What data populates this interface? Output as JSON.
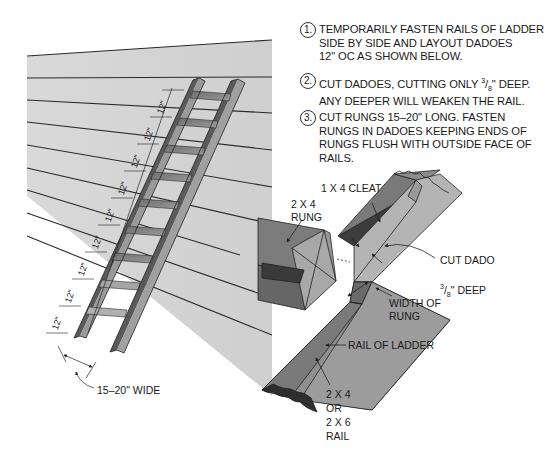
{
  "steps": [
    {
      "number": "1.",
      "text": "TEMPORARILY FASTEN RAILS OF LADDER\nSIDE BY SIDE AND LAYOUT DADOES\n12\" OC AS SHOWN BELOW."
    },
    {
      "number": "2.",
      "text_before": "CUT DADOES, CUTTING ONLY ",
      "frac_num": "3",
      "frac_den": "8",
      "text_after": "\" DEEP.\nANY DEEPER WILL WEAKEN THE RAIL."
    },
    {
      "number": "3.",
      "text": "CUT RUNGS 15–20\" LONG. FASTEN\nRUNGS IN DADOES KEEPING ENDS OF\nRUNGS FLUSH WITH OUTSIDE FACE OF\nRAILS."
    }
  ],
  "ladder": {
    "rung_spacing_label": "12\"",
    "rung_spacing_count": 9,
    "width_label": "15–20\" WIDE"
  },
  "detail_labels": {
    "cleat": "1 X 4 CLEAT",
    "rung": "2 X 4\nRUNG",
    "cut_dado_line1": "CUT DADO",
    "cut_dado_frac_num": "3",
    "cut_dado_frac_den": "8",
    "cut_dado_line2_after": "\" DEEP",
    "width_of_rung": "WIDTH OF\nRUNG",
    "rail_of_ladder": "RAIL OF LADDER",
    "rail_size": "2 X 4\nOR\n2 X 6\nRAIL"
  },
  "colors": {
    "wall": "#d4d4d4",
    "line": "#2a2a2a",
    "wood_dark": "#5c5c5c",
    "wood_mid": "#8a8a8a",
    "wood_light": "#b5b5b5",
    "end_grain": "#2e2e2e"
  }
}
